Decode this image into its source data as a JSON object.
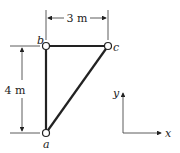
{
  "nodes": {
    "a": {
      "label": "a",
      "x": 46,
      "y": 133
    },
    "b": {
      "label": "b",
      "x": 46,
      "y": 46
    },
    "c": {
      "label": "c",
      "x": 108,
      "y": 46
    }
  },
  "dimensions": {
    "horizontal": "3 m",
    "vertical": "4 m"
  },
  "axes": {
    "x_label": "x",
    "y_label": "y"
  },
  "colors": {
    "member": "#222222",
    "node_fill": "#ffffff"
  }
}
